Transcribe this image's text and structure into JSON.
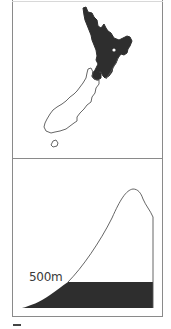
{
  "figure": {
    "panels": [
      {
        "id": "map",
        "description": "Map of New Zealand with North Island shaded dark and South Island outlined",
        "regions": [
          {
            "name": "north-island",
            "style": "filled"
          },
          {
            "name": "south-island",
            "style": "outline"
          },
          {
            "name": "stewart-island",
            "style": "outline"
          }
        ]
      },
      {
        "id": "profile",
        "description": "Elevation profile with shaded band below 500m",
        "threshold_label": "500m"
      }
    ],
    "colors": {
      "fill": "#2e2e2e",
      "line": "#555555",
      "border": "#8a8a8a",
      "background": "#ffffff"
    }
  }
}
